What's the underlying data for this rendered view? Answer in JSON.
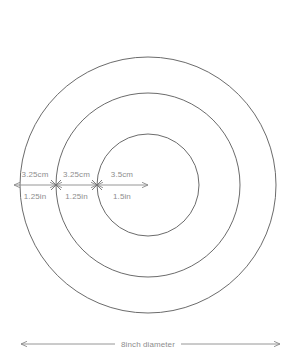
{
  "diagram": {
    "background_color": "#ffffff",
    "stroke_color": "#5a5a5a",
    "label_color": "#8d8d8d",
    "center": {
      "x": 148,
      "y": 185
    },
    "circles": [
      {
        "name": "outer-circle",
        "radius": 128
      },
      {
        "name": "middle-circle",
        "radius": 92
      },
      {
        "name": "inner-circle",
        "radius": 51
      }
    ],
    "radial_dimensions": [
      {
        "name": "segment-outer",
        "metric": "3.25cm",
        "imperial": "1.25in",
        "from_x": 14,
        "to_x": 56
      },
      {
        "name": "segment-middle",
        "metric": "3.25cm",
        "imperial": "1.25in",
        "from_x": 56,
        "to_x": 97
      },
      {
        "name": "segment-inner",
        "metric": "3.5cm",
        "imperial": "1.5in",
        "from_x": 97,
        "to_x": 148
      }
    ],
    "overall_dimension": {
      "name": "overall-diameter",
      "label": "8inch diameter",
      "from_x": 21,
      "to_x": 280,
      "y": 344
    }
  }
}
